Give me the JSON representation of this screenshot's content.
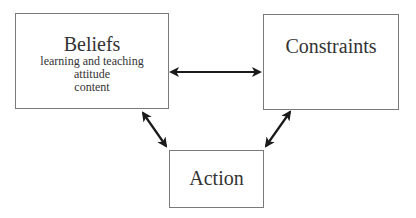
{
  "diagram": {
    "nodes": {
      "beliefs": {
        "title": "Beliefs",
        "items": [
          "learning and teaching",
          "attitude",
          "content"
        ]
      },
      "constraints": {
        "title": "Constraints"
      },
      "action": {
        "title": "Action"
      }
    },
    "edges": [
      {
        "from": "Beliefs",
        "to": "Constraints",
        "type": "bidirectional"
      },
      {
        "from": "Beliefs",
        "to": "Action",
        "type": "bidirectional"
      },
      {
        "from": "Constraints",
        "to": "Action",
        "type": "bidirectional"
      }
    ],
    "colors": {
      "box_border": "#7a7a7a",
      "arrow": "#1a1a1a",
      "text": "#333333"
    }
  }
}
